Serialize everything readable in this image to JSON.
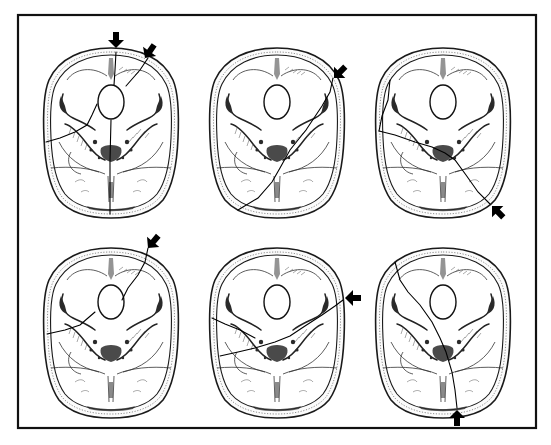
{
  "figure": {
    "frame": {
      "x": 18,
      "y": 15,
      "width": 518,
      "height": 413
    },
    "colors": {
      "line": "#111111",
      "background": "#ffffff"
    },
    "panels": [
      {
        "id": "panel-1",
        "row": 1,
        "col": 1,
        "center": [
          111,
          132
        ],
        "arrows": [
          {
            "x": 116,
            "y": 38,
            "direction": "down"
          },
          {
            "x": 150,
            "y": 47,
            "direction": "down-left"
          }
        ],
        "fractures": [
          "M116,52 L115,70 L114,85",
          "M148,58 L140,70 L126,86",
          "M111,120 L110,160 L110,214",
          "M97,104 L92,115 L87,125 L75,132 L60,138 L46,142"
        ]
      },
      {
        "id": "panel-2",
        "row": 1,
        "col": 2,
        "center": [
          277,
          132
        ],
        "arrows": [
          {
            "x": 340,
            "y": 70,
            "direction": "down-left"
          }
        ],
        "fractures": [
          "M333,78 L330,92 L322,106 L306,130 L290,150 L280,168 L272,182 L258,198 L238,210"
        ]
      },
      {
        "id": "panel-3",
        "row": 1,
        "col": 3,
        "center": [
          443,
          132
        ],
        "arrows": [
          {
            "x": 500,
            "y": 212,
            "direction": "up-left"
          }
        ],
        "fractures": [
          "M379,131 L395,135 L415,142 L432,147 L445,153 L455,160 L466,175 L478,192 L490,204",
          "M380,130 L388,140 L400,148 L420,152 L440,152"
        ]
      },
      {
        "id": "panel-4",
        "row": 2,
        "col": 1,
        "center": [
          111,
          332
        ],
        "arrows": [
          {
            "x": 155,
            "y": 238,
            "direction": "down-left"
          }
        ],
        "fractures": [
          "M148,248 L145,262 L138,275 L128,288 L122,300",
          "M95,312 L88,318 L80,325 L65,330 L47,334"
        ]
      },
      {
        "id": "panel-5",
        "row": 2,
        "col": 2,
        "center": [
          277,
          332
        ],
        "arrows": [
          {
            "x": 356,
            "y": 296,
            "direction": "left"
          }
        ],
        "fractures": [
          "M343,300 L335,306 L322,315 L305,326 L290,336 L275,342 L255,348 L238,352 L220,356",
          "M212,318 L225,324 L240,330 L255,338"
        ]
      },
      {
        "id": "panel-6",
        "row": 2,
        "col": 3,
        "center": [
          443,
          332
        ],
        "arrows": [
          {
            "x": 457,
            "y": 418,
            "direction": "up"
          }
        ],
        "fractures": [
          "M457,408 L455,390 L452,372 L446,352 L440,338 L432,322 L420,305 L408,292 L400,280 L395,262"
        ]
      }
    ]
  }
}
